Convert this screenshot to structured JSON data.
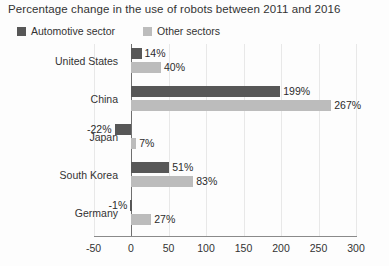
{
  "chart_data": {
    "type": "bar",
    "orientation": "horizontal",
    "title": "Percentage change in the use of robots between 2011 and 2016",
    "xlabel": "",
    "ylabel": "",
    "xlim": [
      -50,
      300
    ],
    "xticks": [
      -50,
      0,
      50,
      100,
      150,
      200,
      250,
      300
    ],
    "xtick_labels": [
      "-50",
      "0",
      "50",
      "100",
      "150",
      "200",
      "250",
      "300"
    ],
    "grid": true,
    "legend_position": "top-left",
    "categories": [
      "United States",
      "China",
      "Japan",
      "South Korea",
      "Germany"
    ],
    "series": [
      {
        "name": "Automotive sector",
        "color": "#575757",
        "values": [
          14,
          199,
          -22,
          51,
          -1
        ],
        "value_labels": [
          "14%",
          "199%",
          "-22%",
          "51%",
          "-1%"
        ]
      },
      {
        "name": "Other sectors",
        "color": "#bcbcbc",
        "values": [
          40,
          267,
          7,
          83,
          27
        ],
        "value_labels": [
          "40%",
          "267%",
          "7%",
          "83%",
          "27%"
        ]
      }
    ]
  }
}
